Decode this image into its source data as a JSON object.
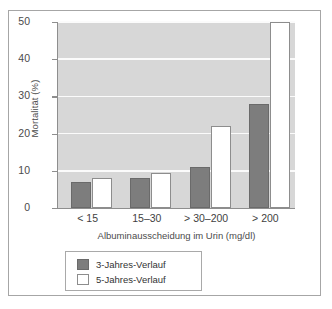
{
  "chart_data": {
    "type": "bar",
    "title": "",
    "xlabel": "Albuminausscheidung im Urin (mg/dl)",
    "ylabel": "Mortalität (%)",
    "categories": [
      "< 15",
      "15–30",
      "> 30–200",
      "> 200"
    ],
    "ylim": [
      0,
      50
    ],
    "yticks": [
      0,
      10,
      20,
      30,
      40,
      50
    ],
    "ytick_labels": [
      "0",
      "10",
      "20",
      "30",
      "40",
      "50"
    ],
    "grid": true,
    "legend_position": "below-axes-left",
    "series": [
      {
        "name": "3-Jahres-Verlauf",
        "color": "#7d7d7d",
        "values": [
          7,
          8,
          11,
          28
        ]
      },
      {
        "name": "5-Jahres-Verlauf",
        "color": "#ffffff",
        "values": [
          8.2,
          9.5,
          22,
          50
        ]
      }
    ]
  },
  "colors": {
    "plot_background": "#d7d7d7",
    "gridline": "#fbfbfb",
    "axis": "#8e8e8e",
    "frame": "#a6a6a6",
    "series_dark": "#7d7d7d",
    "series_light": "#ffffff",
    "text": "#4b4b4b"
  }
}
